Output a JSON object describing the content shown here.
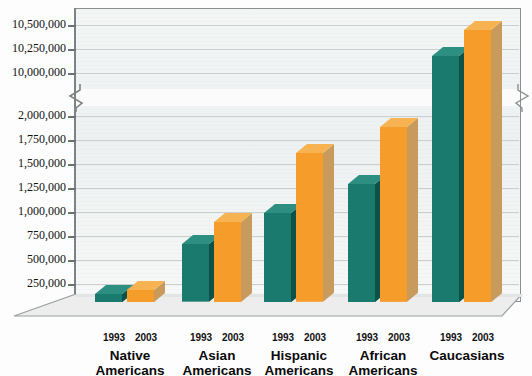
{
  "chart_data": {
    "type": "bar",
    "title": "",
    "subtitle": "",
    "xlabel": "",
    "ylabel": "",
    "grid": true,
    "legend_position": "none",
    "axis_break": {
      "present": true,
      "below": 2000000,
      "above": 10000000,
      "note": "y-axis broken between 2,000,000 and 10,000,000"
    },
    "categories": [
      "Native Americans",
      "Asian Americans",
      "Hispanic Americans",
      "African Americans",
      "Caucasians"
    ],
    "series": [
      {
        "name": "1993",
        "color": "#1a7a6e",
        "values": [
          90000,
          620000,
          960000,
          1270000,
          10180000
        ]
      },
      {
        "name": "2003",
        "color": "#f59c2a",
        "values": [
          130000,
          860000,
          1600000,
          1880000,
          10450000
        ]
      }
    ],
    "ytick_labels": [
      "10,500,000",
      "10,250,000",
      "10,000,000",
      "2,000,000",
      "1,750,000",
      "1,500,000",
      "1,250,000",
      "1,000,000",
      "750,000",
      "500,000",
      "250,000"
    ],
    "ylim_lower": [
      0,
      2000000
    ],
    "ylim_upper": [
      10000000,
      10500000
    ]
  },
  "groups": [
    {
      "label_line1": "Native",
      "label_line2": "Americans",
      "year_a": "1993",
      "year_b": "2003"
    },
    {
      "label_line1": "Asian",
      "label_line2": "Americans",
      "year_a": "1993",
      "year_b": "2003"
    },
    {
      "label_line1": "Hispanic",
      "label_line2": "Americans",
      "year_a": "1993",
      "year_b": "2003"
    },
    {
      "label_line1": "African",
      "label_line2": "Americans",
      "year_a": "1993",
      "year_b": "2003"
    },
    {
      "label_line1": "Caucasians",
      "label_line2": "",
      "year_a": "1993",
      "year_b": "2003"
    }
  ],
  "colors": {
    "series_1993_front": "#1a7a6e",
    "series_1993_side": "#0d5248",
    "series_1993_top": "#2d8f82",
    "series_2003_front": "#f59c2a",
    "series_2003_side": "#c89a5c",
    "series_2003_top": "#f7b351",
    "plot_bg": "#f1f4f4",
    "gridline": "#c9cfcf",
    "frame": "#8a8f90",
    "floor": "#ececec"
  }
}
